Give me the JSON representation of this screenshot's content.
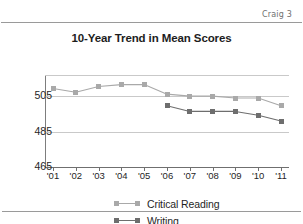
{
  "page": {
    "header_text": "Craig 3",
    "footer_ghost_text": ""
  },
  "colors": {
    "critical_reading": "#a9a9a9",
    "writing": "#6e6e6e",
    "gridline": "#c9c9c9",
    "axis": "#6f6f6f",
    "title": "#1d1d1d"
  },
  "legend": {
    "position": "bottom",
    "items": [
      {
        "label": "Critical Reading",
        "color": "#a9a9a9"
      },
      {
        "label": "Writing",
        "color": "#6e6e6e"
      }
    ]
  },
  "chart_data": {
    "type": "line",
    "title": "10-Year Trend in Mean Scores",
    "xlabel": "",
    "ylabel": "",
    "grid": true,
    "ylim": [
      465,
      513
    ],
    "yticks": [
      465,
      485,
      505
    ],
    "ytick_labels": [
      "465",
      "485",
      "505"
    ],
    "categories": [
      "'01",
      "'02",
      "'03",
      "'04",
      "'05",
      "'06",
      "'07",
      "'08",
      "'09",
      "'10",
      "'11"
    ],
    "series": [
      {
        "name": "Critical Reading",
        "color": "#a9a9a9",
        "values": [
          506,
          504,
          507,
          508,
          508,
          503,
          502,
          502,
          501,
          501,
          497
        ]
      },
      {
        "name": "Writing",
        "color": "#6e6e6e",
        "values": [
          null,
          null,
          null,
          null,
          null,
          497,
          494,
          494,
          494,
          492,
          489
        ]
      }
    ]
  }
}
